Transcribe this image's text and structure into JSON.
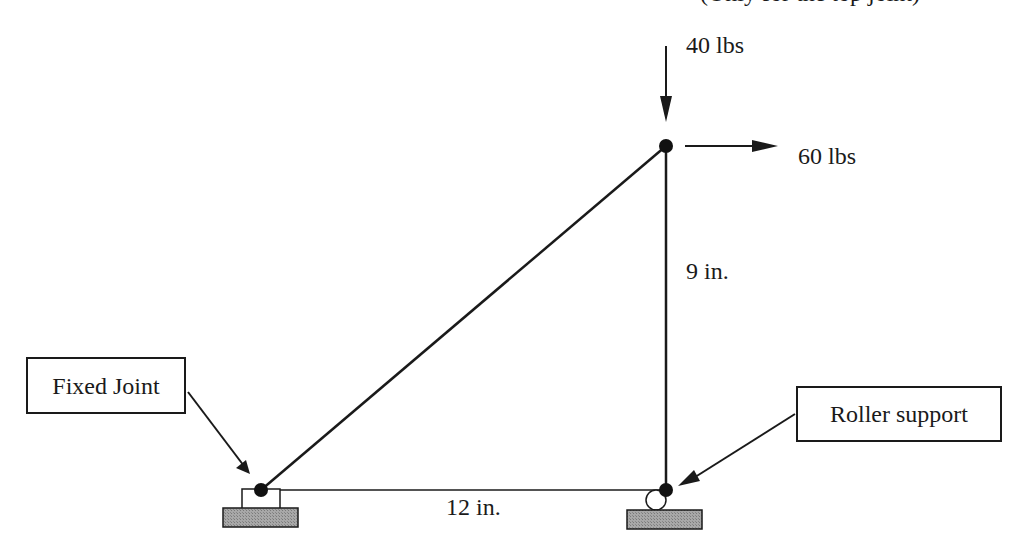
{
  "header": {
    "clipped_note": "(Only for the top joint)"
  },
  "loads": {
    "vertical": {
      "label": "40 lbs",
      "direction": "down"
    },
    "horizontal": {
      "label": "60 lbs",
      "direction": "right"
    }
  },
  "dimensions": {
    "vertical": "9 in.",
    "horizontal": "12 in."
  },
  "callouts": {
    "fixed": "Fixed Joint",
    "roller": "Roller support"
  },
  "colors": {
    "line": "#1a1a1a",
    "ground": "#9a9a9a"
  }
}
